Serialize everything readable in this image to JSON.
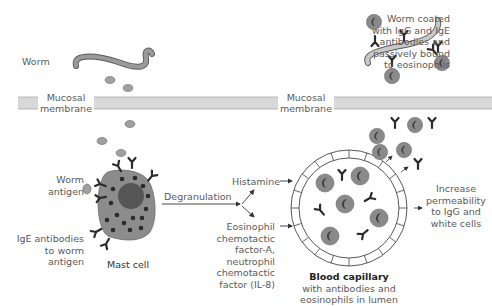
{
  "labels": {
    "worm": "Worm",
    "worm_coated": [
      "Worm coated",
      "with IgG and IgE",
      "antibodies and",
      "passively bound",
      "to eosinophils"
    ],
    "mucosal_membrane_left": [
      "Mucosal",
      "membrane"
    ],
    "mucosal_membrane_right": [
      "Mucosal",
      "membrane"
    ],
    "worm_antigen": [
      "Worm",
      "antigen"
    ],
    "ige_antibodies": [
      "IgE antibodies",
      "to worm",
      "antigen"
    ],
    "mast_cell": "Mast cell",
    "degranulation": "Degranulation",
    "histamine": "Histamine",
    "chemotactic": [
      "Eosinophil",
      "chemotactic",
      "factor-A,",
      "neutrophil",
      "chemotactic",
      "factor (IL-8)"
    ],
    "blood_capillary_title": "Blood capillary",
    "blood_capillary_sub": [
      "with antibodies and",
      "eosinophils in lumen"
    ],
    "increase_permeability": [
      "Increase",
      "permeability",
      "to IgG and",
      "white cells"
    ]
  },
  "colors": {
    "membrane": "#d9d9d9",
    "membrane_edge": "#a8a8a8",
    "worm_fill": "#9a9a9a",
    "cell_fill": "#8c8c8c",
    "nucleus": "#555555",
    "granule": "#2a2a2a",
    "antigen": "#a0a0a0",
    "antibody": "#2b2b2b",
    "text": "#5a5a5a"
  }
}
